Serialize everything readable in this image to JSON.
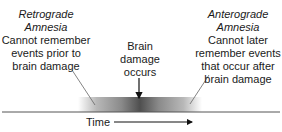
{
  "diagram": {
    "type": "timeline",
    "left": {
      "title_line1": "Retrograde",
      "title_line2": "Amnesia",
      "desc_line1": "Cannot remember",
      "desc_line2": "events prior to",
      "desc_line3": "brain damage"
    },
    "center": {
      "line1": "Brain",
      "line2": "damage",
      "line3": "occurs"
    },
    "right": {
      "title_line1": "Anterograde",
      "title_line2": "Amnesia",
      "desc_line1": "Cannot later",
      "desc_line2": "remember events",
      "desc_line3": "that occur after",
      "desc_line4": "brain damage"
    },
    "axis": {
      "label": "Time"
    },
    "colors": {
      "text": "#1a1a1a",
      "line": "#555555",
      "gradient_dark": "#4a4a4a",
      "gradient_light": "#ffffff"
    }
  }
}
